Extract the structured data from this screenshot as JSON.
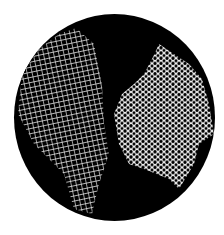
{
  "image": {
    "subject": "microscope view of cork cells",
    "description": "Circular black field of view showing two white mesh-like cellular tissue samples: an elongated rectangular-celled strip on the left and an irregular honeycomb patch on the right.",
    "colors": {
      "background": "#ffffff",
      "field": "#000000",
      "cells": "#f2f2f2"
    }
  }
}
